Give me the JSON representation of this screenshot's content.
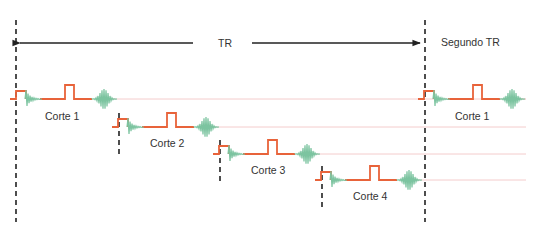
{
  "labels": {
    "tr": "TR",
    "segundo_tr": "Segundo TR"
  },
  "slices": [
    {
      "label": "Corte 1",
      "x0": 10,
      "y": 99,
      "label_x": 45,
      "label_y": 120
    },
    {
      "label": "Corte 2",
      "x0": 112,
      "y": 127,
      "label_x": 150,
      "label_y": 147
    },
    {
      "label": "Corte 3",
      "x0": 213,
      "y": 154,
      "label_x": 251,
      "label_y": 174
    },
    {
      "label": "Corte 4",
      "x0": 315,
      "y": 180,
      "label_x": 353,
      "label_y": 200
    },
    {
      "label": "Corte 1",
      "x0": 418,
      "y": 99,
      "label_x": 455,
      "label_y": 120
    }
  ],
  "tr_lines": {
    "left_x": 16,
    "right_x": 425,
    "top": 20,
    "bottom": 222
  },
  "arrow": {
    "y": 43,
    "left_end": 20,
    "left_stop": 193,
    "right_start": 252,
    "right_end": 420,
    "label_x": 225
  },
  "colors": {
    "rf_pulse": "#e8633a",
    "echo": "#7cc4a0",
    "guide": "#f4cccc",
    "axis": "#222222"
  }
}
